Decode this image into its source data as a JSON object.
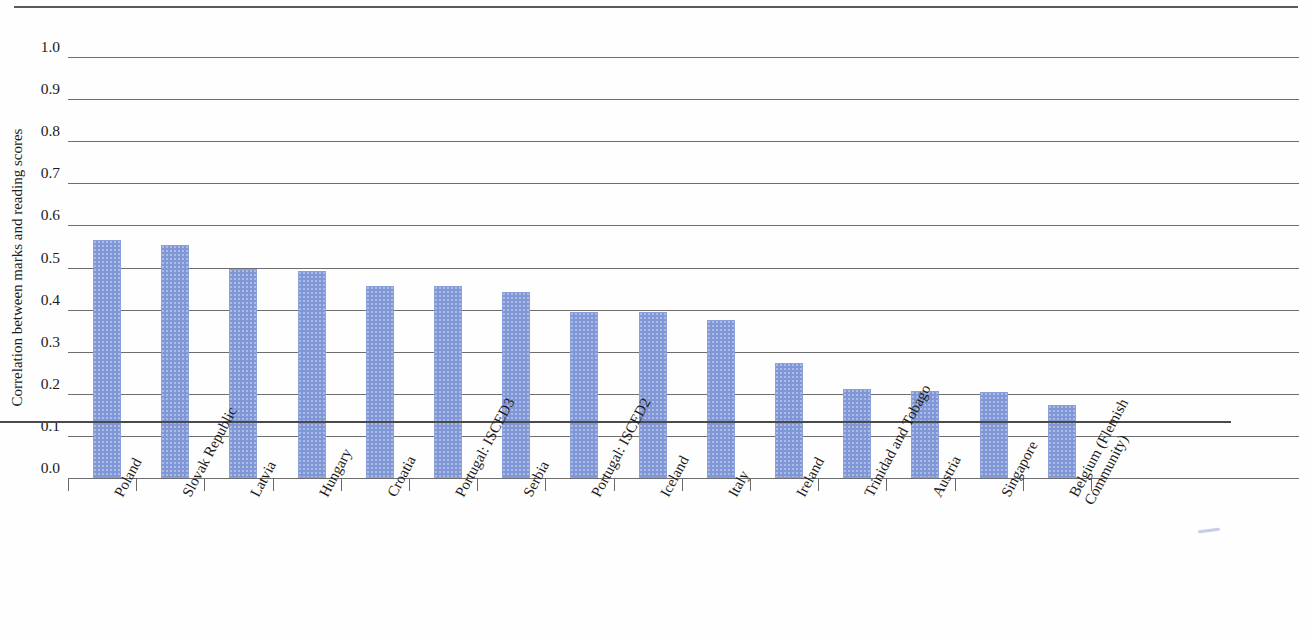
{
  "chart_data": {
    "type": "bar",
    "title": "",
    "xlabel": "",
    "ylabel": "Correlation between marks and reading scores",
    "ylim": [
      0.0,
      1.0
    ],
    "ytick_labels": [
      "1.0",
      "0.9",
      "0.8",
      "0.7",
      "0.6",
      "0.5",
      "0.4",
      "0.3",
      "0.2",
      "0.1",
      "0.0"
    ],
    "ytick_values": [
      1.0,
      0.9,
      0.8,
      0.7,
      0.6,
      0.5,
      0.4,
      0.3,
      0.2,
      0.1,
      0.0
    ],
    "grid": true,
    "legend": false,
    "bar_color": "#7f97d6",
    "categories": [
      "Poland",
      "Slovak Republic",
      "Latvia",
      "Hungary",
      "Croatia",
      "Portugal: ISCED3",
      "Serbia",
      "Portugal: ISCED2",
      "Iceland",
      "Italy",
      "Ireland",
      "Trinidad and Tobago",
      "Austria",
      "Singapore",
      "Belgium (Flemish Community)"
    ],
    "categories_wrapped": [
      [
        "Poland"
      ],
      [
        "Slovak Republic"
      ],
      [
        "Latvia"
      ],
      [
        "Hungary"
      ],
      [
        "Croatia"
      ],
      [
        "Portugal: ISCED3"
      ],
      [
        "Serbia"
      ],
      [
        "Portugal: ISCED2"
      ],
      [
        "Iceland"
      ],
      [
        "Italy"
      ],
      [
        "Ireland"
      ],
      [
        "Trinidad and Tobago"
      ],
      [
        "Austria"
      ],
      [
        "Singapore"
      ],
      [
        "Belgium (Flemish",
        "Community)"
      ]
    ],
    "values": [
      0.565,
      0.553,
      0.497,
      0.491,
      0.455,
      0.455,
      0.443,
      0.395,
      0.394,
      0.376,
      0.273,
      0.212,
      0.206,
      0.205,
      0.173
    ]
  }
}
